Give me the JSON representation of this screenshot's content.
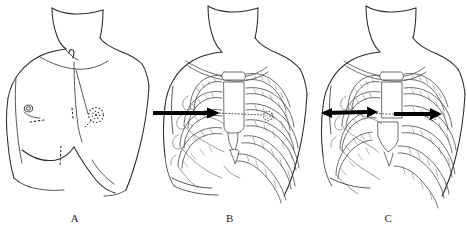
{
  "figure": {
    "kind": "medical-line-art-illustration",
    "background_color": "#ffffff",
    "ink_color": "#2a2a2a",
    "arrow_color": "#000000",
    "panel_count": 3
  },
  "panels": [
    {
      "id": "a",
      "label": "A",
      "caption_letter": "A",
      "content": "surface anatomy of male torso: neck, clavicles, suprasternal notch, shoulders, nipples, costal margin",
      "markers": [
        {
          "name": "left-nipple",
          "type": "small-spiral-circle"
        },
        {
          "name": "target-site-marker",
          "type": "dotted-circle"
        },
        {
          "name": "incision-dashed-line-upper",
          "type": "dashed-line"
        },
        {
          "name": "incision-dashed-line-lower",
          "type": "dashed-line"
        },
        {
          "name": "suprasternal-notch",
          "type": "small-arc"
        }
      ],
      "has_arrow": false
    },
    {
      "id": "b",
      "label": "B",
      "caption_letter": "B",
      "content": "thoracic cage overlay on torso: ribs, costal cartilage, sternum, clavicle, scapula; single black arrow indicating approach direction toward sternum",
      "markers": [
        {
          "name": "approach-arrow",
          "type": "solid-black-arrow",
          "direction": "right"
        },
        {
          "name": "dotted-trajectory",
          "type": "dotted-line"
        },
        {
          "name": "target-site-marker",
          "type": "dotted-circle"
        }
      ],
      "has_arrow": true,
      "arrow_count": 1
    },
    {
      "id": "c",
      "label": "C",
      "caption_letter": "C",
      "content": "thoracic cage with widened / retracted intercostal space; two black arrows on either side showing bidirectional retraction across the sternum",
      "markers": [
        {
          "name": "retraction-arrow-left",
          "type": "solid-black-arrow",
          "direction": "left"
        },
        {
          "name": "retraction-arrow-right",
          "type": "solid-black-arrow",
          "direction": "right"
        },
        {
          "name": "dotted-trajectory",
          "type": "dotted-line"
        },
        {
          "name": "target-site-marker",
          "type": "dotted-circle"
        }
      ],
      "has_arrow": true,
      "arrow_count": 2
    }
  ]
}
